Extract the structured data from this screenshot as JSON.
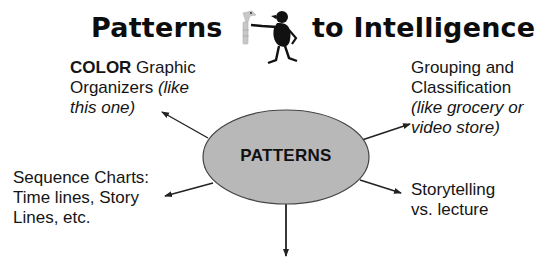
{
  "title": {
    "left": "Patterns",
    "right": "to Intelligence",
    "figure_icon": "stick-figure-holding-giraffe-icon"
  },
  "center": {
    "label": "PATTERNS",
    "fill": "#b8b8b8",
    "stroke": "#444444"
  },
  "nodes": {
    "color_organizers": {
      "line1_bold": "COLOR",
      "line1_rest": " Graphic",
      "line2_normal": "Organizers ",
      "line2_italic": "(like",
      "line3_italic": "this one)"
    },
    "grouping": {
      "line1": "Grouping and",
      "line2": "Classification",
      "line3_italic": "(like grocery or",
      "line4_italic": "video store)"
    },
    "sequence": {
      "line1": "Sequence Charts:",
      "line2": "Time lines, Story",
      "line3": "Lines, etc."
    },
    "storytelling": {
      "line1": "Storytelling",
      "line2": "vs. lecture"
    }
  },
  "colors": {
    "text": "#151515",
    "arrow": "#222222",
    "background": "#ffffff"
  }
}
